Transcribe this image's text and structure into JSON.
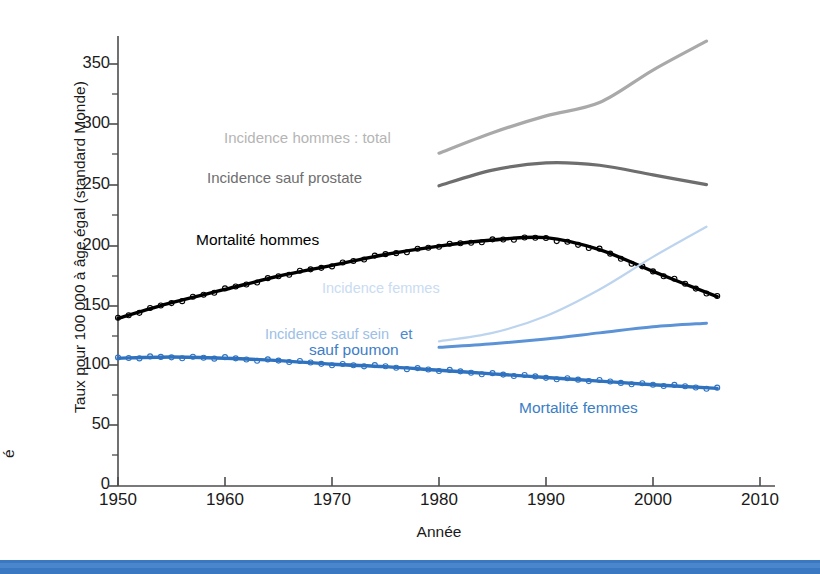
{
  "chart_data": {
    "type": "line",
    "title": "",
    "xlabel": "Année",
    "ylabel": "Taux pour 100 000 à âge égal (standard Monde)",
    "xlim": [
      1950,
      2010
    ],
    "ylim": [
      0,
      375
    ],
    "xticks": [
      1950,
      1960,
      1970,
      1980,
      1990,
      2000,
      2010
    ],
    "yticks": [
      0,
      50,
      100,
      150,
      200,
      250,
      300,
      350
    ],
    "yminorticks": [
      25,
      75,
      125,
      175,
      225,
      275,
      325
    ],
    "grid": false,
    "legend_position": "in-plot annotations",
    "series": [
      {
        "name": "Incidence hommes : total",
        "color": "#a9a9a9",
        "markers": false,
        "x": [
          1980,
          1985,
          1990,
          1995,
          2000,
          2005
        ],
        "values": [
          276,
          293,
          307,
          318,
          345,
          369
        ]
      },
      {
        "name": "Incidence sauf prostate",
        "color": "#6e6e6e",
        "markers": false,
        "x": [
          1980,
          1985,
          1990,
          1995,
          2000,
          2005
        ],
        "values": [
          249,
          262,
          268,
          266,
          258,
          250
        ]
      },
      {
        "name": "Mortalité hommes",
        "color": "#000000",
        "markers": true,
        "x": [
          1950,
          1955,
          1960,
          1965,
          1970,
          1975,
          1980,
          1985,
          1990,
          1995,
          2000,
          2006
        ],
        "values": [
          139,
          152,
          163,
          174,
          183,
          192,
          199,
          204,
          206,
          196,
          178,
          157
        ]
      },
      {
        "name": "Incidence femmes",
        "color": "#bdd4ef",
        "markers": false,
        "x": [
          1980,
          1985,
          1990,
          1995,
          2000,
          2005
        ],
        "values": [
          120,
          127,
          141,
          163,
          190,
          215
        ]
      },
      {
        "name": "Incidence sauf sein et sauf poumon",
        "color": "#5b93d6",
        "markers": false,
        "x": [
          1980,
          1985,
          1990,
          1995,
          2000,
          2005
        ],
        "values": [
          115,
          118,
          122,
          127,
          132,
          135
        ]
      },
      {
        "name": "Mortalité femmes",
        "color": "#2f72bf",
        "markers": true,
        "x": [
          1950,
          1955,
          1960,
          1965,
          1970,
          1975,
          1980,
          1985,
          1990,
          1995,
          2000,
          2006
        ],
        "values": [
          106,
          107,
          106,
          104,
          101,
          99,
          96,
          93,
          90,
          87,
          84,
          81
        ]
      }
    ],
    "annotations": [
      {
        "id": "incidence-hommes-total",
        "text": "Incidence hommes : total",
        "color": "#b5b5b5",
        "x": 224,
        "y": 130
      },
      {
        "id": "incidence-sauf-prostate",
        "text": "Incidence sauf prostate",
        "color": "#6e6e6e",
        "x": 207,
        "y": 170
      },
      {
        "id": "mortalite-hommes",
        "text": "Mortalité hommes",
        "color": "#000000",
        "x": 196,
        "y": 232
      },
      {
        "id": "incidence-femmes",
        "text": "Incidence femmes",
        "color": "#c9dcf2",
        "x": 322,
        "y": 281
      },
      {
        "id": "incidence-sauf-sein-1",
        "text": "Incidence sauf sein",
        "color": "#9dc0e6",
        "x": 265,
        "y": 327
      },
      {
        "id": "incidence-sauf-sein-2",
        "text": "et",
        "color": "#4d8ace",
        "x": 400,
        "y": 326
      },
      {
        "id": "sauf-poumon",
        "text": "sauf poumon",
        "color": "#3d7dc6",
        "x": 309,
        "y": 342
      },
      {
        "id": "mortalite-femmes",
        "text": "Mortalité femmes",
        "color": "#3a7ec5",
        "x": 519,
        "y": 400
      }
    ]
  },
  "axis": {
    "ylabel_text": "Taux pour 100 000 à âge égal (standard Monde)",
    "xlabel_text": "Année",
    "edge_fragment": "é",
    "ytick_labels": [
      "350",
      "300",
      "250",
      "200",
      "150",
      "100",
      "50",
      "0"
    ],
    "xtick_labels": [
      "1950",
      "1960",
      "1970",
      "1980",
      "1990",
      "2000",
      "2010"
    ]
  },
  "decor": {
    "bottom_bar_color": "#3a78c2"
  }
}
